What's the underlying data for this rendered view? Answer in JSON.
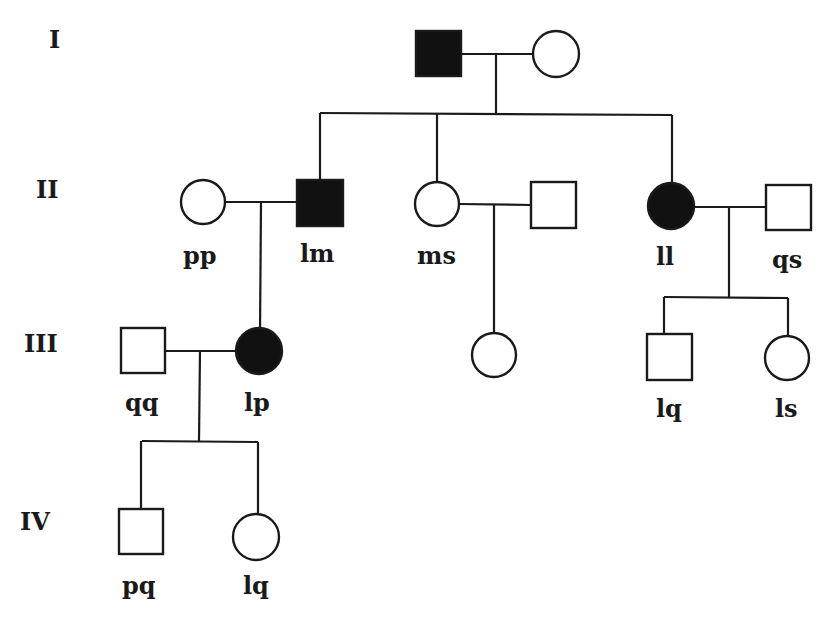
{
  "diagram": {
    "type": "pedigree",
    "generations": [
      "I",
      "II",
      "III",
      "IV"
    ],
    "individuals": [
      {
        "id": "I-1",
        "generation": "I",
        "sex": "male",
        "affected": true,
        "label": ""
      },
      {
        "id": "I-2",
        "generation": "I",
        "sex": "female",
        "affected": false,
        "label": ""
      },
      {
        "id": "II-1",
        "generation": "II",
        "sex": "female",
        "affected": false,
        "label": "pp"
      },
      {
        "id": "II-2",
        "generation": "II",
        "sex": "male",
        "affected": true,
        "label": "lm"
      },
      {
        "id": "II-3",
        "generation": "II",
        "sex": "female",
        "affected": false,
        "label": "ms"
      },
      {
        "id": "II-4",
        "generation": "II",
        "sex": "male",
        "affected": false,
        "label": ""
      },
      {
        "id": "II-5",
        "generation": "II",
        "sex": "female",
        "affected": true,
        "label": "ll"
      },
      {
        "id": "II-6",
        "generation": "II",
        "sex": "male",
        "affected": false,
        "label": "qs"
      },
      {
        "id": "III-1",
        "generation": "III",
        "sex": "male",
        "affected": false,
        "label": "qq"
      },
      {
        "id": "III-2",
        "generation": "III",
        "sex": "female",
        "affected": true,
        "label": "lp"
      },
      {
        "id": "III-3",
        "generation": "III",
        "sex": "female",
        "affected": false,
        "label": ""
      },
      {
        "id": "III-4",
        "generation": "III",
        "sex": "male",
        "affected": false,
        "label": "lq"
      },
      {
        "id": "III-5",
        "generation": "III",
        "sex": "female",
        "affected": false,
        "label": "ls"
      },
      {
        "id": "IV-1",
        "generation": "IV",
        "sex": "male",
        "affected": false,
        "label": "pq"
      },
      {
        "id": "IV-2",
        "generation": "IV",
        "sex": "female",
        "affected": false,
        "label": "lq"
      }
    ],
    "matings": [
      {
        "partners": [
          "I-1",
          "I-2"
        ],
        "children": [
          "II-2",
          "II-3",
          "II-5"
        ]
      },
      {
        "partners": [
          "II-1",
          "II-2"
        ],
        "children": [
          "III-2"
        ]
      },
      {
        "partners": [
          "II-3",
          "II-4"
        ],
        "children": [
          "III-3"
        ]
      },
      {
        "partners": [
          "II-5",
          "II-6"
        ],
        "children": [
          "III-4",
          "III-5"
        ]
      },
      {
        "partners": [
          "III-1",
          "III-2"
        ],
        "children": [
          "IV-1",
          "IV-2"
        ]
      }
    ]
  },
  "labels": {
    "gen_I": "I",
    "gen_II": "II",
    "gen_III": "III",
    "gen_IV": "IV",
    "pp": "pp",
    "lm": "lm",
    "ms": "ms",
    "ll": "ll",
    "qs": "qs",
    "qq": "qq",
    "lp": "lp",
    "lq_III": "lq",
    "ls": "ls",
    "pq": "pq",
    "lq_IV": "lq"
  },
  "colors": {
    "affected_fill": "#111111",
    "unaffected_fill": "#ffffff",
    "stroke": "#1a1a1a",
    "background": "#ffffff"
  }
}
